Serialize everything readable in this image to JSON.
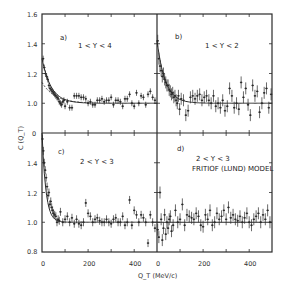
{
  "chart_data": {
    "type": "scatter",
    "title": "",
    "xlabel": "Q_T (MeV/c)",
    "ylabel": "C (Q_T)",
    "xlim": [
      0,
      500
    ],
    "grid": false,
    "layout": "2x2 panels sharing axes",
    "panels": [
      {
        "id": "a",
        "label": "a)",
        "annotation": "1 < Y < 4",
        "ylim": [
          0.8,
          1.6
        ],
        "yticks": [
          1.0,
          1.2,
          1.4,
          1.6
        ],
        "xticks": [],
        "fit_curves": [
          "solid exponential fit",
          "dashed fit"
        ],
        "series": [
          {
            "name": "data",
            "x": [
              5,
              10,
              15,
              20,
              25,
              30,
              35,
              40,
              45,
              50,
              55,
              60,
              65,
              70,
              75,
              80,
              85,
              90,
              95,
              100,
              110,
              120,
              130,
              140,
              150,
              160,
              170,
              180,
              190,
              200,
              210,
              220,
              230,
              240,
              250,
              260,
              270,
              280,
              290,
              300,
              310,
              320,
              330,
              340,
              350,
              360,
              370,
              380,
              390,
              400,
              410,
              420,
              430,
              440,
              450,
              460,
              470,
              480,
              490
            ],
            "y": [
              1.3,
              1.24,
              1.2,
              1.18,
              1.16,
              1.12,
              1.1,
              1.09,
              1.08,
              1.07,
              1.06,
              1.05,
              1.04,
              1.03,
              1.01,
              1.0,
              0.99,
              1.01,
              1.02,
              0.98,
              1.01,
              0.97,
              0.97,
              1.05,
              1.05,
              1.05,
              1.04,
              1.04,
              1.03,
              1.0,
              1.01,
              0.99,
              0.99,
              1.02,
              1.02,
              1.03,
              1.01,
              1.02,
              1.02,
              1.04,
              0.99,
              1.02,
              1.02,
              1.01,
              0.98,
              1.03,
              1.03,
              1.06,
              1.0,
              0.98,
              1.07,
              1.0,
              1.05,
              1.04,
              0.99,
              1.06,
              1.08,
              1.04,
              1.02
            ]
          }
        ]
      },
      {
        "id": "b",
        "label": "b)",
        "annotation": "1 < Y < 2",
        "ylim": [
          0.8,
          1.6
        ],
        "yticks": [],
        "xticks": [],
        "fit_curves": [
          "solid exponential fit"
        ],
        "series": [
          {
            "name": "data",
            "x": [
              3,
              8,
              13,
              18,
              23,
              28,
              33,
              38,
              43,
              48,
              53,
              58,
              63,
              68,
              73,
              78,
              83,
              88,
              93,
              98,
              105,
              115,
              125,
              135,
              145,
              155,
              165,
              175,
              185,
              195,
              205,
              215,
              225,
              235,
              245,
              255,
              265,
              275,
              285,
              295,
              305,
              315,
              325,
              335,
              345,
              355,
              365,
              375,
              385,
              395,
              405,
              415,
              425,
              435,
              445,
              455,
              465,
              475,
              485,
              495
            ],
            "y": [
              1.42,
              1.3,
              1.25,
              1.22,
              1.18,
              1.2,
              1.16,
              1.14,
              1.12,
              1.12,
              1.09,
              1.08,
              1.06,
              1.07,
              1.04,
              1.05,
              1.02,
              1.0,
              1.05,
              0.96,
              1.03,
              1.02,
              0.92,
              0.95,
              1.04,
              1.05,
              1.03,
              1.05,
              1.06,
              1.02,
              1.04,
              1.05,
              1.02,
              1.0,
              1.05,
              0.98,
              1.0,
              0.97,
              1.02,
              0.95,
              0.98,
              1.1,
              1.05,
              0.97,
              1.0,
              0.96,
              1.14,
              1.04,
              1.1,
              0.99,
              0.92,
              1.12,
              1.05,
              1.08,
              0.94,
              1.0,
              1.07,
              1.1,
              0.97,
              1.06
            ]
          }
        ]
      },
      {
        "id": "c",
        "label": "c)",
        "annotation": "2 < Y < 3",
        "ylim": [
          0.8,
          1.6
        ],
        "yticks": [
          0.8,
          1.0,
          1.2,
          1.4
        ],
        "xticks": [
          0,
          200,
          400
        ],
        "fit_curves": [
          "solid exponential fit"
        ],
        "series": [
          {
            "name": "data",
            "x": [
              2,
              6,
              10,
              14,
              18,
              22,
              26,
              30,
              34,
              38,
              42,
              46,
              50,
              55,
              60,
              65,
              70,
              75,
              80,
              90,
              100,
              110,
              120,
              130,
              140,
              150,
              160,
              170,
              180,
              190,
              200,
              210,
              220,
              230,
              240,
              250,
              260,
              270,
              280,
              290,
              300,
              310,
              320,
              330,
              340,
              350,
              360,
              370,
              380,
              390,
              400,
              410,
              420,
              430,
              440,
              450,
              460,
              470,
              480,
              490
            ],
            "y": [
              1.56,
              1.48,
              1.4,
              1.35,
              1.3,
              1.24,
              1.18,
              1.2,
              1.12,
              1.14,
              1.1,
              1.08,
              1.06,
              1.05,
              1.04,
              1.0,
              1.02,
              1.01,
              1.07,
              1.0,
              1.02,
              1.04,
              1.0,
              1.03,
              0.99,
              1.02,
              0.99,
              0.98,
              1.0,
              1.13,
              1.06,
              1.04,
              1.0,
              1.02,
              1.03,
              1.01,
              1.0,
              1.0,
              1.02,
              1.0,
              0.99,
              1.02,
              1.03,
              1.0,
              1.0,
              1.04,
              0.98,
              1.0,
              1.15,
              0.98,
              1.08,
              1.05,
              1.0,
              1.05,
              1.03,
              1.0,
              0.86,
              1.05,
              1.0,
              0.96
            ]
          }
        ]
      },
      {
        "id": "d",
        "label": "d)",
        "annotation": "2 < Y < 3\nFRITIOF (LUND) MODEL",
        "ylim": [
          0.8,
          1.6
        ],
        "yticks": [],
        "xticks": [
          0,
          200,
          400
        ],
        "fit_curves": [
          "horizontal line at 1.0"
        ],
        "series": [
          {
            "name": "data",
            "x": [
              3,
              8,
              13,
              18,
              23,
              28,
              33,
              38,
              43,
              48,
              53,
              58,
              63,
              70,
              80,
              90,
              100,
              110,
              120,
              130,
              140,
              150,
              160,
              170,
              180,
              190,
              200,
              210,
              220,
              230,
              240,
              250,
              260,
              270,
              280,
              290,
              300,
              310,
              320,
              330,
              340,
              350,
              360,
              370,
              380,
              390,
              400,
              410,
              420,
              430,
              440,
              450,
              460,
              470,
              480,
              490
            ],
            "y": [
              0.95,
              0.9,
              1.2,
              1.02,
              0.88,
              0.96,
              1.05,
              0.92,
              1.0,
              0.96,
              1.02,
              1.04,
              0.94,
              0.98,
              1.08,
              1.0,
              1.02,
              1.12,
              0.98,
              1.05,
              1.04,
              1.03,
              1.02,
              1.06,
              1.04,
              0.98,
              0.97,
              1.05,
              1.02,
              1.08,
              0.98,
              1.0,
              1.06,
              1.02,
              1.04,
              1.08,
              1.02,
              1.1,
              1.03,
              1.05,
              1.02,
              1.01,
              1.04,
              1.0,
              1.03,
              1.06,
              1.0,
              0.98,
              1.02,
              1.04,
              1.06,
              1.0,
              1.05,
              1.02,
              1.08,
              1.0
            ]
          }
        ]
      }
    ]
  },
  "labels": {
    "ylabel": "C (Q_T)",
    "xlabel": "Q_T (MeV/c)",
    "panel_a": "a)",
    "panel_a_range": "1 < Y < 4",
    "panel_b": "b)",
    "panel_b_range": "1 < Y < 2",
    "panel_c": "c)",
    "panel_c_range": "2 < Y < 3",
    "panel_d": "d)",
    "panel_d_range": "2 < Y < 3",
    "panel_d_model": "FRITIOF (LUND) MODEL",
    "ytick_top": [
      "1.6",
      "1.4",
      "1.2",
      "1.0",
      "0"
    ],
    "ytick_bottom": [
      "1.4",
      "1.2",
      "1.0",
      "0.8"
    ],
    "xtick_left": [
      "0",
      "200",
      "400"
    ],
    "xtick_right": [
      "0",
      "200",
      "400"
    ]
  }
}
